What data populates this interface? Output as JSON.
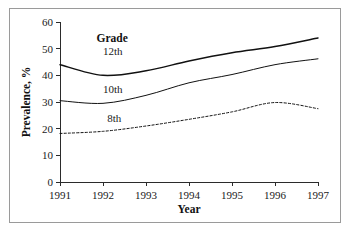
{
  "chart_data": {
    "type": "line",
    "title": "",
    "xlabel": "Year",
    "ylabel": "Prevalence, %",
    "legend_title": "Grade",
    "legend_position": "inline-left",
    "grid": false,
    "x": [
      1991,
      1992,
      1993,
      1994,
      1995,
      1996,
      1997
    ],
    "xtick_labels": [
      "1991",
      "1992",
      "1993",
      "1994",
      "1995",
      "1996",
      "1997"
    ],
    "ytick_labels": [
      "0",
      "10",
      "20",
      "30",
      "40",
      "50",
      "60"
    ],
    "ytick_values": [
      0,
      10,
      20,
      30,
      40,
      50,
      60
    ],
    "xlim": [
      1991,
      1997
    ],
    "ylim": [
      0,
      60
    ],
    "series": [
      {
        "name": "12th",
        "label": "12th",
        "style": "solid-thick",
        "color": "#111111",
        "values": [
          44.0,
          40.0,
          41.7,
          45.4,
          48.5,
          50.8,
          54.0
        ]
      },
      {
        "name": "10th",
        "label": "10th",
        "style": "solid-thin",
        "color": "#111111",
        "values": [
          30.5,
          29.5,
          32.5,
          37.2,
          40.3,
          44.0,
          46.2
        ]
      },
      {
        "name": "8th",
        "label": "8th",
        "style": "dotted",
        "color": "#111111",
        "values": [
          18.2,
          19.0,
          21.0,
          23.5,
          26.3,
          29.8,
          27.5
        ]
      }
    ],
    "series_labels": [
      {
        "text": "12th",
        "x": 1992.0,
        "y": 47.5
      },
      {
        "text": "10th",
        "x": 1992.0,
        "y": 33.5
      },
      {
        "text": "8th",
        "x": 1992.1,
        "y": 22.5
      }
    ],
    "legend_title_anchor": {
      "x": 1991.85,
      "y": 52.5
    }
  },
  "colors": {
    "ink": "#111111",
    "axis": "#2b2b2b",
    "border": "#9a9a9a",
    "background": "#ffffff"
  }
}
